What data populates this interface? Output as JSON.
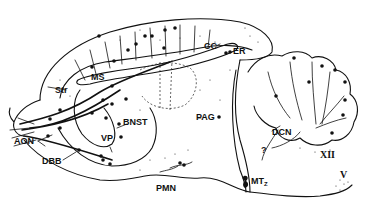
{
  "figure": {
    "type": "sagittal brain section diagram",
    "ink_color": "#111111",
    "background": "#ffffff"
  },
  "labels": {
    "cc": "CC",
    "er": "ER",
    "ms": "MS",
    "str": "Str",
    "aon": "AON",
    "bnst": "BNST",
    "vp": "VP",
    "dbb": "DBB",
    "pmn": "PMN",
    "pag": "PAG",
    "dcn": "DCN",
    "question": "?",
    "mtz_main": "MT",
    "mtz_sub": "Z",
    "xii": "XII",
    "v": "V"
  }
}
